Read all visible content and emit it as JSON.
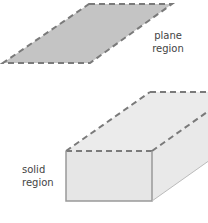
{
  "labels": {
    "plane": [
      "plane",
      "region"
    ],
    "solid": [
      "solid",
      "region"
    ]
  },
  "colors": {
    "plane_fill": "#c4c4c4",
    "solid_front": "#e6e6e6",
    "solid_top": "#ebebeb",
    "solid_side": "#e9e9e9",
    "edge": "#7a7a7a"
  }
}
